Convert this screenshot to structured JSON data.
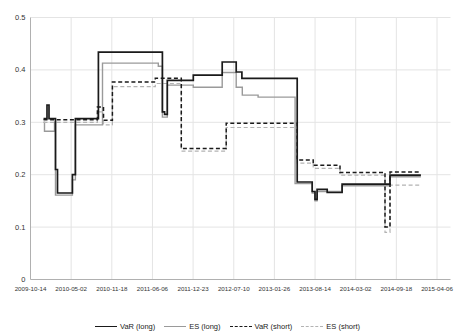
{
  "figure": {
    "background": "#ffffff",
    "grid_color": "#e4e4e4",
    "axis_color": "#b0b0b0",
    "tick_label_color": "#333333"
  },
  "chart_data": {
    "type": "line",
    "subtype": "step",
    "grid": true,
    "legend_position": "bottom",
    "ylim": [
      0,
      0.5
    ],
    "x_unit": "days since 2009-10-14",
    "x_range_days": [
      0,
      2000
    ],
    "y_ticks": {
      "labels": [
        "0",
        "0.1",
        "0.2",
        "0.3",
        "0.4",
        "0.5"
      ],
      "values": [
        0,
        0.1,
        0.2,
        0.3,
        0.4,
        0.5
      ]
    },
    "x_ticks": {
      "labels": [
        "2009-10-14",
        "2010-05-02",
        "2010-11-18",
        "2011-06-06",
        "2011-12-23",
        "2012-07-10",
        "2013-01-26",
        "2013-08-14",
        "2014-03-02",
        "2014-09-18",
        "2015-04-06"
      ],
      "days": [
        0,
        200,
        400,
        600,
        800,
        1000,
        1200,
        1400,
        1600,
        1800,
        2000
      ]
    },
    "series": [
      {
        "name": "VaR (long)",
        "style": "solid",
        "color": "#1a1a1a",
        "width": 1.7,
        "end_day": 1921,
        "points": [
          [
            64,
            0.307
          ],
          [
            81,
            0.333
          ],
          [
            91,
            0.307
          ],
          [
            123,
            0.21
          ],
          [
            133,
            0.165
          ],
          [
            206,
            0.2
          ],
          [
            221,
            0.307
          ],
          [
            334,
            0.434
          ],
          [
            649,
            0.32
          ],
          [
            660,
            0.315
          ],
          [
            673,
            0.38
          ],
          [
            801,
            0.39
          ],
          [
            943,
            0.415
          ],
          [
            1012,
            0.396
          ],
          [
            1040,
            0.384
          ],
          [
            1312,
            0.186
          ],
          [
            1386,
            0.168
          ],
          [
            1400,
            0.153
          ],
          [
            1410,
            0.172
          ],
          [
            1460,
            0.166
          ],
          [
            1533,
            0.182
          ],
          [
            1769,
            0.199
          ]
        ]
      },
      {
        "name": "ES (long)",
        "style": "solid",
        "color": "#9a9a9a",
        "width": 1.4,
        "end_day": 1921,
        "points": [
          [
            64,
            0.3
          ],
          [
            69,
            0.283
          ],
          [
            118,
            0.3
          ],
          [
            123,
            0.161
          ],
          [
            206,
            0.19
          ],
          [
            221,
            0.295
          ],
          [
            354,
            0.413
          ],
          [
            629,
            0.407
          ],
          [
            649,
            0.31
          ],
          [
            673,
            0.371
          ],
          [
            801,
            0.367
          ],
          [
            943,
            0.395
          ],
          [
            1012,
            0.367
          ],
          [
            1042,
            0.352
          ],
          [
            1120,
            0.348
          ],
          [
            1302,
            0.183
          ],
          [
            1386,
            0.165
          ],
          [
            1400,
            0.15
          ],
          [
            1410,
            0.168
          ],
          [
            1533,
            0.179
          ],
          [
            1769,
            0.196
          ]
        ]
      },
      {
        "name": "VaR (short)",
        "style": "dashed",
        "color": "#1a1a1a",
        "width": 1.5,
        "end_day": 1921,
        "points": [
          [
            64,
            0.305
          ],
          [
            329,
            0.329
          ],
          [
            359,
            0.304
          ],
          [
            403,
            0.377
          ],
          [
            614,
            0.384
          ],
          [
            742,
            0.25
          ],
          [
            963,
            0.298
          ],
          [
            1312,
            0.228
          ],
          [
            1391,
            0.218
          ],
          [
            1523,
            0.204
          ],
          [
            1744,
            0.1
          ],
          [
            1769,
            0.205
          ]
        ]
      },
      {
        "name": "ES (short)",
        "style": "dashed",
        "color": "#b3b3b3",
        "width": 1.2,
        "end_day": 1921,
        "points": [
          [
            64,
            0.3
          ],
          [
            329,
            0.32
          ],
          [
            359,
            0.295
          ],
          [
            403,
            0.368
          ],
          [
            614,
            0.374
          ],
          [
            742,
            0.245
          ],
          [
            963,
            0.29
          ],
          [
            1312,
            0.222
          ],
          [
            1391,
            0.212
          ],
          [
            1523,
            0.199
          ],
          [
            1744,
            0.09
          ],
          [
            1769,
            0.18
          ]
        ]
      }
    ]
  },
  "legend": {
    "items": [
      {
        "label": "VaR (long)"
      },
      {
        "label": "ES (long)"
      },
      {
        "label": "VaR (short)"
      },
      {
        "label": "ES (short)"
      }
    ]
  }
}
